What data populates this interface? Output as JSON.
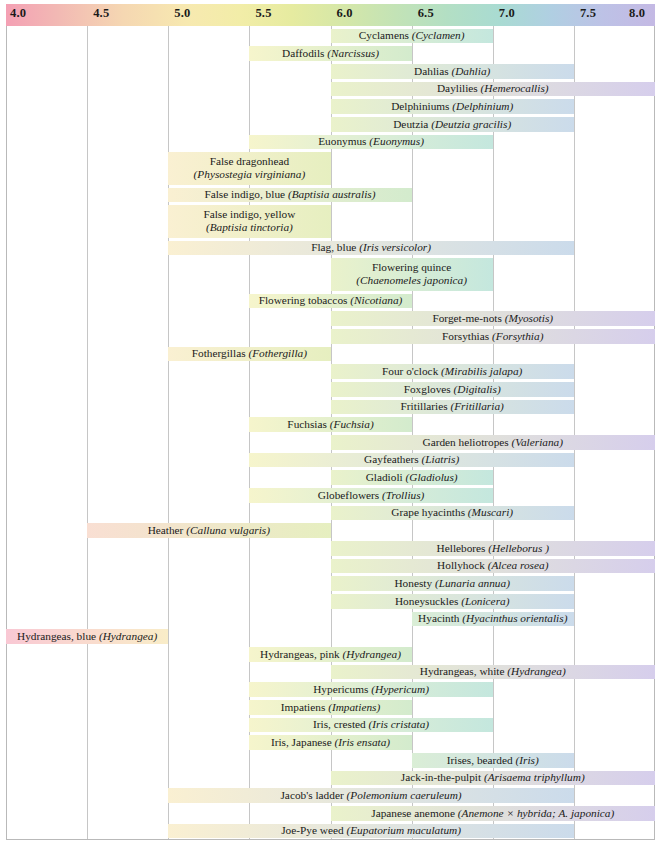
{
  "axis": {
    "label": "pH",
    "min": 4.0,
    "max": 8.0,
    "ticks": [
      {
        "value": 4.0,
        "label": "4.0"
      },
      {
        "value": 4.5,
        "label": "4.5"
      },
      {
        "value": 5.0,
        "label": "5.0"
      },
      {
        "value": 5.5,
        "label": "5.5"
      },
      {
        "value": 6.0,
        "label": "6.0"
      },
      {
        "value": 6.5,
        "label": "6.5"
      },
      {
        "value": 7.0,
        "label": "7.0"
      },
      {
        "value": 7.5,
        "label": "7.5"
      },
      {
        "value": 8.0,
        "label": "8.0"
      }
    ],
    "gradient_stops": [
      "#f4a0b4",
      "#f5d7b2",
      "#f2eda8",
      "#d5e7a8",
      "#b3dfc4",
      "#a9dbd2",
      "#b0cfe2",
      "#c4b9e4"
    ]
  },
  "chart_data": {
    "type": "bar",
    "orientation": "horizontal",
    "xlabel": "pH",
    "ylabel": "",
    "xlim": [
      4.0,
      8.0
    ],
    "grid": true,
    "legend": "none",
    "note": "Each horizontal bar spans the pH range tolerated by that plant; bar fill color tracks the pH color scale in the header.",
    "categories": [
      "Cyclamens (Cyclamen)",
      "Daffodils (Narcissus)",
      "Dahlias (Dahlia)",
      "Daylilies (Hemerocallis)",
      "Delphiniums (Delphinium)",
      "Deutzia (Deutzia gracilis)",
      "Euonymus (Euonymus)",
      "False dragonhead (Physostegia virginiana)",
      "False indigo, blue (Baptisia australis)",
      "False indigo, yellow (Baptisia tinctoria)",
      "Flag, blue (Iris versicolor)",
      "Flowering quince (Chaenomeles japonica)",
      "Flowering tobaccos (Nicotiana)",
      "Forget-me-nots (Myosotis)",
      "Forsythias (Forsythia)",
      "Fothergillas (Fothergilla)",
      "Four o'clock (Mirabilis jalapa)",
      "Foxgloves (Digitalis)",
      "Fritillaries (Fritillaria)",
      "Fuchsias (Fuchsia)",
      "Garden heliotropes (Valeriana)",
      "Gayfeathers (Liatris)",
      "Gladioli (Gladiolus)",
      "Globeflowers (Trollius)",
      "Grape hyacinths (Muscari)",
      "Heather (Calluna vulgaris)",
      "Hellebores (Helleborus )",
      "Hollyhock (Alcea rosea)",
      "Honesty (Lunaria annua)",
      "Honeysuckles (Lonicera)",
      "Hyacinth (Hyacinthus orientalis)",
      "Hydrangeas, blue (Hydrangea)",
      "Hydrangeas, pink (Hydrangea)",
      "Hydrangeas, white (Hydrangea)",
      "Hypericums (Hypericum)",
      "Impatiens (Impatiens)",
      "Iris, crested (Iris cristata)",
      "Iris, Japanese (Iris ensata)",
      "Irises, bearded (Iris)",
      "Jack-in-the-pulpit (Arisaema triphyllum)",
      "Jacob's ladder (Polemonium caeruleum)",
      "Japanese anemone (Anemone × hybrida; A. japonica)",
      "Joe-Pye weed (Eupatorium maculatum)"
    ],
    "ranges": [
      [
        6.0,
        7.0
      ],
      [
        5.5,
        6.5
      ],
      [
        6.0,
        7.5
      ],
      [
        6.0,
        8.0
      ],
      [
        6.0,
        7.5
      ],
      [
        6.0,
        7.5
      ],
      [
        5.5,
        7.0
      ],
      [
        5.0,
        6.0
      ],
      [
        5.0,
        6.5
      ],
      [
        5.0,
        6.0
      ],
      [
        5.0,
        7.5
      ],
      [
        6.0,
        7.0
      ],
      [
        5.5,
        6.5
      ],
      [
        6.0,
        8.0
      ],
      [
        6.0,
        8.0
      ],
      [
        5.0,
        6.0
      ],
      [
        6.0,
        7.5
      ],
      [
        6.0,
        7.5
      ],
      [
        6.0,
        7.5
      ],
      [
        5.5,
        6.5
      ],
      [
        6.0,
        8.0
      ],
      [
        5.5,
        7.5
      ],
      [
        6.0,
        7.0
      ],
      [
        5.5,
        7.0
      ],
      [
        6.0,
        7.5
      ],
      [
        4.5,
        6.0
      ],
      [
        6.0,
        8.0
      ],
      [
        6.0,
        8.0
      ],
      [
        6.0,
        7.5
      ],
      [
        6.0,
        7.5
      ],
      [
        6.5,
        7.5
      ],
      [
        4.0,
        5.0
      ],
      [
        5.5,
        6.5
      ],
      [
        6.0,
        8.0
      ],
      [
        5.5,
        7.0
      ],
      [
        5.5,
        6.5
      ],
      [
        5.5,
        7.0
      ],
      [
        5.5,
        6.5
      ],
      [
        6.5,
        7.5
      ],
      [
        6.0,
        8.0
      ],
      [
        5.0,
        7.5
      ],
      [
        6.0,
        8.0
      ],
      [
        5.0,
        7.5
      ]
    ],
    "rows": [
      {
        "name": "Cyclamens",
        "latin": "Cyclamen",
        "min": 6.0,
        "max": 7.0,
        "lines": 1
      },
      {
        "name": "Daffodils",
        "latin": "Narcissus",
        "min": 5.5,
        "max": 6.5,
        "lines": 1
      },
      {
        "name": "Dahlias",
        "latin": "Dahlia",
        "min": 6.0,
        "max": 7.5,
        "lines": 1
      },
      {
        "name": "Daylilies",
        "latin": "Hemerocallis",
        "min": 6.0,
        "max": 8.0,
        "lines": 1
      },
      {
        "name": "Delphiniums",
        "latin": "Delphinium",
        "min": 6.0,
        "max": 7.5,
        "lines": 1
      },
      {
        "name": "Deutzia",
        "latin": "Deutzia gracilis",
        "min": 6.0,
        "max": 7.5,
        "lines": 1
      },
      {
        "name": "Euonymus",
        "latin": "Euonymus",
        "min": 5.5,
        "max": 7.0,
        "lines": 1
      },
      {
        "name": "False dragonhead",
        "latin": "Physostegia virginiana",
        "min": 5.0,
        "max": 6.0,
        "lines": 2
      },
      {
        "name": "False indigo, blue",
        "latin": "Baptisia australis",
        "min": 5.0,
        "max": 6.5,
        "lines": 1
      },
      {
        "name": "False indigo, yellow",
        "latin": "Baptisia tinctoria",
        "min": 5.0,
        "max": 6.0,
        "lines": 2
      },
      {
        "name": "Flag, blue",
        "latin": "Iris versicolor",
        "min": 5.0,
        "max": 7.5,
        "lines": 1
      },
      {
        "name": "Flowering quince",
        "latin": "Chaenomeles japonica",
        "min": 6.0,
        "max": 7.0,
        "lines": 2
      },
      {
        "name": "Flowering tobaccos",
        "latin": "Nicotiana",
        "min": 5.5,
        "max": 6.5,
        "lines": 1
      },
      {
        "name": "Forget-me-nots",
        "latin": "Myosotis",
        "min": 6.0,
        "max": 8.0,
        "lines": 1
      },
      {
        "name": "Forsythias",
        "latin": "Forsythia",
        "min": 6.0,
        "max": 8.0,
        "lines": 1
      },
      {
        "name": "Fothergillas",
        "latin": "Fothergilla",
        "min": 5.0,
        "max": 6.0,
        "lines": 1
      },
      {
        "name": "Four o'clock",
        "latin": "Mirabilis jalapa",
        "min": 6.0,
        "max": 7.5,
        "lines": 1
      },
      {
        "name": "Foxgloves",
        "latin": "Digitalis",
        "min": 6.0,
        "max": 7.5,
        "lines": 1
      },
      {
        "name": "Fritillaries",
        "latin": "Fritillaria",
        "min": 6.0,
        "max": 7.5,
        "lines": 1
      },
      {
        "name": "Fuchsias",
        "latin": "Fuchsia",
        "min": 5.5,
        "max": 6.5,
        "lines": 1
      },
      {
        "name": "Garden heliotropes",
        "latin": "Valeriana",
        "min": 6.0,
        "max": 8.0,
        "lines": 1
      },
      {
        "name": "Gayfeathers",
        "latin": "Liatris",
        "min": 5.5,
        "max": 7.5,
        "lines": 1
      },
      {
        "name": "Gladioli",
        "latin": "Gladiolus",
        "min": 6.0,
        "max": 7.0,
        "lines": 1
      },
      {
        "name": "Globeflowers",
        "latin": "Trollius",
        "min": 5.5,
        "max": 7.0,
        "lines": 1
      },
      {
        "name": "Grape hyacinths",
        "latin": "Muscari",
        "min": 6.0,
        "max": 7.5,
        "lines": 1
      },
      {
        "name": "Heather",
        "latin": "Calluna vulgaris",
        "min": 4.5,
        "max": 6.0,
        "lines": 1
      },
      {
        "name": "Hellebores",
        "latin": "Helleborus ",
        "min": 6.0,
        "max": 8.0,
        "lines": 1
      },
      {
        "name": "Hollyhock",
        "latin": "Alcea rosea",
        "min": 6.0,
        "max": 8.0,
        "lines": 1
      },
      {
        "name": "Honesty",
        "latin": "Lunaria annua",
        "min": 6.0,
        "max": 7.5,
        "lines": 1
      },
      {
        "name": "Honeysuckles",
        "latin": "Lonicera",
        "min": 6.0,
        "max": 7.5,
        "lines": 1
      },
      {
        "name": "Hyacinth",
        "latin": "Hyacinthus orientalis",
        "min": 6.5,
        "max": 7.5,
        "lines": 1
      },
      {
        "name": "Hydrangeas, blue",
        "latin": "Hydrangea",
        "min": 4.0,
        "max": 5.0,
        "lines": 1
      },
      {
        "name": "Hydrangeas, pink",
        "latin": "Hydrangea",
        "min": 5.5,
        "max": 6.5,
        "lines": 1
      },
      {
        "name": "Hydrangeas, white",
        "latin": "Hydrangea",
        "min": 6.0,
        "max": 8.0,
        "lines": 1
      },
      {
        "name": "Hypericums",
        "latin": "Hypericum",
        "min": 5.5,
        "max": 7.0,
        "lines": 1
      },
      {
        "name": "Impatiens",
        "latin": "Impatiens",
        "min": 5.5,
        "max": 6.5,
        "lines": 1
      },
      {
        "name": "Iris, crested",
        "latin": "Iris cristata",
        "min": 5.5,
        "max": 7.0,
        "lines": 1
      },
      {
        "name": "Iris, Japanese",
        "latin": "Iris ensata",
        "min": 5.5,
        "max": 6.5,
        "lines": 1
      },
      {
        "name": "Irises, bearded",
        "latin": "Iris",
        "min": 6.5,
        "max": 7.5,
        "lines": 1
      },
      {
        "name": "Jack-in-the-pulpit",
        "latin": "Arisaema triphyllum",
        "min": 6.0,
        "max": 8.0,
        "lines": 1
      },
      {
        "name": "Jacob's ladder",
        "latin": "Polemonium caeruleum",
        "min": 5.0,
        "max": 7.5,
        "lines": 1
      },
      {
        "name": "Japanese anemone",
        "latin": "Anemone × hybrida; A. japonica",
        "min": 6.0,
        "max": 8.0,
        "lines": 1
      },
      {
        "name": "Joe-Pye weed",
        "latin": "Eupatorium maculatum",
        "min": 5.0,
        "max": 7.5,
        "lines": 1
      }
    ]
  }
}
